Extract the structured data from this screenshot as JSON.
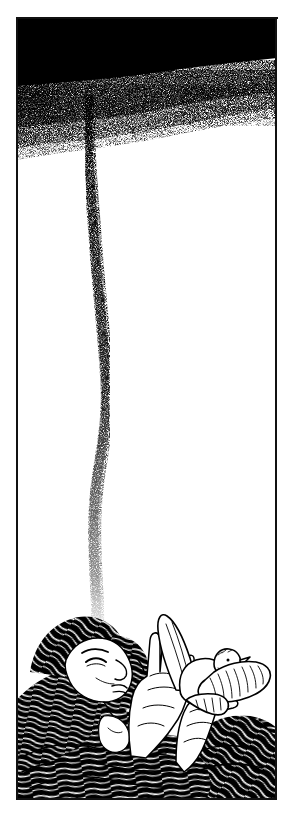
{
  "artwork": {
    "title": "Woman Releasing a Dove Beneath a Dark Sky",
    "medium": "pen-and-ink line illustration",
    "style": "black-and-white stipple and hatching",
    "orientation": "vertical portrait panel",
    "canvas": {
      "width": 295,
      "height": 821,
      "background_color": "#ffffff",
      "ink_color": "#000000"
    },
    "frame": {
      "name": "border-frame",
      "left": 16,
      "top": 17,
      "right": 277,
      "bottom": 800,
      "stroke_color": "#111111",
      "stroke_width": 2,
      "description": "hand-drawn rectangular ink border enclosing the scene"
    },
    "regions": [
      {
        "id": "sky",
        "label": "Dark Sky",
        "description": "solid black band across the top that dissolves downward into dense stipple, heaviest at the left and fading to white toward the right",
        "bounds": {
          "x": 16,
          "y": 17,
          "width": 261,
          "height": 115
        },
        "fill_color": "#000000"
      },
      {
        "id": "stipple-trail",
        "label": "Falling Stipple Trail",
        "description": "a narrow wavering column of ink dots that drops from the dark cloud down the centre-left of the panel and dissipates just above the figure's hair",
        "start": {
          "x": 88,
          "y": 100
        },
        "end": {
          "x": 96,
          "y": 630
        },
        "ink_color": "#000000"
      },
      {
        "id": "white-field",
        "label": "Empty White Field",
        "description": "large untouched white expanse occupying the middle of the panel",
        "bounds": {
          "x": 16,
          "y": 132,
          "width": 261,
          "height": 480
        },
        "fill_color": "#ffffff"
      },
      {
        "id": "figure",
        "label": "Reclining Woman",
        "description": "woman lying on her back seen from the side, face in profile with eyes closed, head tilted back, long dark hair spreading across the lower panel",
        "bounds": {
          "x": 18,
          "y": 612,
          "width": 180,
          "height": 188
        }
      },
      {
        "id": "hands",
        "label": "Raised Hands",
        "description": "two open hands lifted upward with fingers extended, cupping and releasing the bird",
        "bounds": {
          "x": 128,
          "y": 640,
          "width": 80,
          "height": 120
        }
      },
      {
        "id": "dove",
        "label": "Dove in Flight",
        "description": "white dove drawn in outline with fine feather hatching, wings spread wide, rising from the woman's hands",
        "bounds": {
          "x": 148,
          "y": 612,
          "width": 124,
          "height": 110
        }
      },
      {
        "id": "hair",
        "label": "Flowing Hair",
        "description": "dense sweeping curved strokes of black hair filling the bottom of the frame like water or waves",
        "bounds": {
          "x": 16,
          "y": 690,
          "width": 261,
          "height": 110
        }
      }
    ],
    "palette": {
      "ink": "#000000",
      "paper": "#ffffff",
      "frame": "#111111",
      "soft_gray": "#3a3a3a"
    }
  }
}
